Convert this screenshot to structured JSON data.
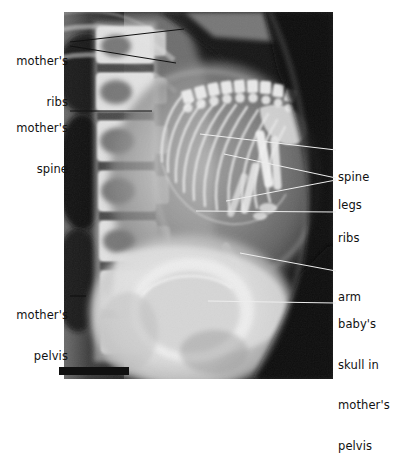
{
  "figure": {
    "kind": "radiograph",
    "plate": {
      "left": 64,
      "top": 12,
      "width": 269,
      "height": 367,
      "background_color": "#0a0a0a"
    },
    "scale_bar": {
      "name": "scale-bar",
      "left": 59,
      "top": 367,
      "width": 70,
      "height": 8,
      "color": "#111111"
    }
  },
  "labels": {
    "left": [
      {
        "id": "mothers-ribs",
        "lines": [
          "mother's",
          "ribs"
        ],
        "text": "mother's ribs",
        "x": 6,
        "y": 28,
        "width": 62,
        "align": "right"
      },
      {
        "id": "mothers-spine",
        "lines": [
          "mother's",
          "spine"
        ],
        "text": "mother's spine",
        "x": 6,
        "y": 95,
        "width": 62,
        "align": "right"
      },
      {
        "id": "mothers-pelvis",
        "lines": [
          "mother's",
          "pelvis"
        ],
        "text": "mother's pelvis",
        "x": 6,
        "y": 280,
        "width": 62,
        "align": "right"
      }
    ],
    "right": [
      {
        "id": "spine",
        "lines": [
          "spine"
        ],
        "text": "spine",
        "x": 338,
        "y": 144,
        "align": "left"
      },
      {
        "id": "legs",
        "lines": [
          "legs"
        ],
        "text": "legs",
        "x": 338,
        "y": 172,
        "align": "left"
      },
      {
        "id": "ribs",
        "lines": [
          "ribs"
        ],
        "text": "ribs",
        "x": 338,
        "y": 204,
        "align": "left"
      },
      {
        "id": "arm",
        "lines": [
          "arm"
        ],
        "text": "arm",
        "x": 338,
        "y": 265,
        "align": "left"
      },
      {
        "id": "babys-skull",
        "lines": [
          "baby's",
          "skull in",
          "mother's",
          "pelvis"
        ],
        "text": "baby's skull in mother's pelvis",
        "x": 338,
        "y": 290,
        "align": "left"
      }
    ]
  },
  "leader_lines": [
    {
      "id": "mothers-ribs-upper",
      "from": [
        70,
        42
      ],
      "to": [
        184,
        29
      ],
      "color": "#111111"
    },
    {
      "id": "mothers-ribs-lower",
      "from": [
        70,
        46
      ],
      "to": [
        176,
        63
      ],
      "color": "#111111"
    },
    {
      "id": "mothers-spine",
      "from": [
        70,
        111
      ],
      "to": [
        152,
        111
      ],
      "color": "#111111"
    },
    {
      "id": "mothers-pelvis-dash",
      "from": [
        70,
        296
      ],
      "to": [
        84,
        296
      ],
      "color": "#111111"
    },
    {
      "id": "spine",
      "from": [
        200,
        134
      ],
      "to": [
        333,
        150
      ],
      "color": "#e8e8e8"
    },
    {
      "id": "legs-upper",
      "from": [
        224,
        154
      ],
      "to": [
        333,
        178
      ],
      "color": "#e8e8e8"
    },
    {
      "id": "legs-lower",
      "from": [
        226,
        201
      ],
      "to": [
        333,
        180
      ],
      "color": "#e8e8e8"
    },
    {
      "id": "ribs",
      "from": [
        196,
        211
      ],
      "to": [
        333,
        212
      ],
      "color": "#e8e8e8"
    },
    {
      "id": "arm",
      "from": [
        240,
        253
      ],
      "to": [
        333,
        271
      ],
      "color": "#e8e8e8"
    },
    {
      "id": "babys-skull",
      "from": [
        208,
        301
      ],
      "to": [
        333,
        303
      ],
      "color": "#e8e8e8"
    }
  ],
  "anatomy": {
    "mother_vertebrae_count": 6,
    "fetal_ribs_count": 11,
    "fetal_structures": [
      "skull",
      "spine",
      "ribs",
      "arm",
      "legs"
    ],
    "maternal_structures": [
      "ribs",
      "spine",
      "pelvis"
    ]
  }
}
